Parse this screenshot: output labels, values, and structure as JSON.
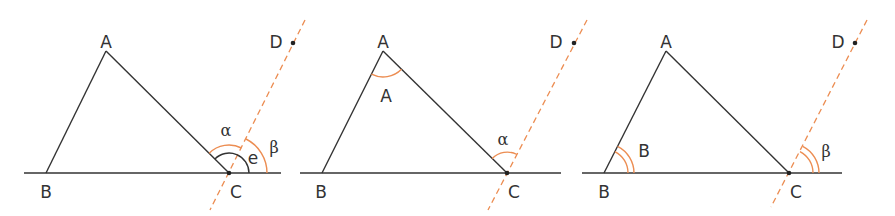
{
  "colors": {
    "line": "#333333",
    "accent": "#ec8d52"
  },
  "panels": [
    {
      "labels": {
        "A": "A",
        "B": "B",
        "C": "C",
        "D": "D",
        "alpha": "α",
        "beta": "β",
        "e": "e"
      }
    },
    {
      "labels": {
        "A": "A",
        "B": "B",
        "C": "C",
        "D": "D",
        "alpha": "α",
        "angleA": "A"
      }
    },
    {
      "labels": {
        "A": "A",
        "B": "B",
        "C": "C",
        "D": "D",
        "beta": "β",
        "angleB": "B"
      }
    }
  ]
}
